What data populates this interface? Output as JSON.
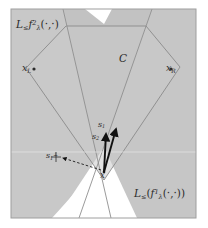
{
  "figure": {
    "caption_labels": {
      "levelset_2": {
        "base": "L",
        "relation": "≤",
        "func": "f",
        "sup": "2",
        "sub": "λ",
        "args": "(·,·)",
        "text": "L≤ f²λ(·,·)"
      },
      "levelset_1": {
        "base": "L",
        "relation": "≤",
        "func": "f",
        "sup": "1",
        "sub": "λ",
        "args": "(·,·)",
        "text": "L≤(f¹λ(·,·))"
      },
      "region_c": "C",
      "vertex_left": {
        "base": "x",
        "sub": "L",
        "text": "xL"
      },
      "vertex_right": {
        "base": "x",
        "sub": "R",
        "text": "xR"
      },
      "vector_s1": {
        "base": "s",
        "sub": "1",
        "text": "s1"
      },
      "vector_s2": {
        "base": "s",
        "sub": "2",
        "text": "s2"
      },
      "vector_s1_perp": {
        "base": "s",
        "sub": "1",
        "sup": "⊥",
        "text": "s1⊥"
      },
      "point_x": "x"
    },
    "colors": {
      "background": "#ffffff",
      "shade_light": "#cdcdcd",
      "shade_mid": "#c4c4c4",
      "shade_dark": "#bcbcbc",
      "outline": "#8f8f8f",
      "frame": "#a8a8a8",
      "ink": "#2b2b2b",
      "vector": "#111111"
    },
    "geometry": {
      "frame": {
        "x": 11,
        "y": 9,
        "width": 185,
        "height": 209
      },
      "polygon_c": [
        [
          26,
          68
        ],
        [
          66,
          26
        ],
        [
          146,
          26
        ],
        [
          180,
          67
        ],
        [
          104,
          180
        ]
      ],
      "halfplane_1_boundary": [
        [
          64,
          9
        ],
        [
          110,
          218
        ]
      ],
      "halfplane_2_boundary": [
        [
          151,
          9
        ],
        [
          80,
          218
        ]
      ],
      "white_wedge_top": [
        [
          86,
          9
        ],
        [
          110,
          9
        ],
        [
          104,
          22
        ]
      ],
      "white_wedge_bottom": [
        [
          104,
          148
        ],
        [
          52,
          218
        ],
        [
          135,
          218
        ]
      ],
      "vector_s1": {
        "from": [
          104,
          172
        ],
        "to": [
          116,
          128
        ]
      },
      "vector_s2": {
        "from": [
          104,
          172
        ],
        "to": [
          106,
          133
        ]
      },
      "dashed_arrow": {
        "from": [
          100,
          170
        ],
        "to": [
          62,
          157
        ]
      }
    }
  }
}
